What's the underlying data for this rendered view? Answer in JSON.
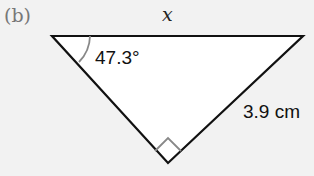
{
  "part_label": "(b)",
  "triangle": {
    "top_side_label": "x",
    "angle_label": "47.3°",
    "hypotenuse_side_label": "3.9 cm",
    "right_angle_at": "bottom vertex",
    "colors": {
      "fill": "#ffffff",
      "stroke": "#111111",
      "marks": "#888888"
    }
  }
}
